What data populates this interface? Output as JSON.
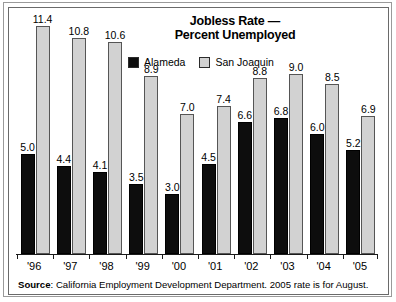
{
  "chart_data": {
    "type": "bar",
    "title": "Jobless Rate — Percent Unemployed",
    "title_line1": "Jobless Rate —",
    "title_line2": "Percent Unemployed",
    "xlabel": "",
    "ylabel": "",
    "ylim": [
      0,
      12
    ],
    "grid": false,
    "legend_position": "top-center",
    "categories": [
      "'96",
      "'97",
      "'98",
      "'99",
      "'00",
      "'01",
      "'02",
      "'03",
      "'04",
      "'05"
    ],
    "series": [
      {
        "name": "Alameda",
        "color": "#0d0d0d",
        "values": [
          5.0,
          4.4,
          4.1,
          3.5,
          3.0,
          4.5,
          6.6,
          6.8,
          6.0,
          5.2
        ],
        "labels": [
          "5.0",
          "4.4",
          "4.1",
          "3.5",
          "3.0",
          "4.5",
          "6.6",
          "6.8",
          "6.0",
          "5.2"
        ]
      },
      {
        "name": "San Joaquin",
        "color": "#d2d2d2",
        "values": [
          11.4,
          10.8,
          10.6,
          8.9,
          7.0,
          7.4,
          8.8,
          9.0,
          8.5,
          6.9
        ],
        "labels": [
          "11.4",
          "10.8",
          "10.6",
          "8.9",
          "7.0",
          "7.4",
          "8.8",
          "9.0",
          "8.5",
          "6.9"
        ]
      }
    ],
    "annotations": [
      "Source: California Employment Development Department. 2005 rate is for August."
    ]
  },
  "legend": {
    "items": [
      {
        "label": "Alameda",
        "color": "#0d0d0d"
      },
      {
        "label": "San Joaquin",
        "color": "#d2d2d2"
      }
    ]
  },
  "source": {
    "prefix": "Source",
    "separator": ": ",
    "text": "California Employment Development Department. 2005 rate is for August."
  }
}
